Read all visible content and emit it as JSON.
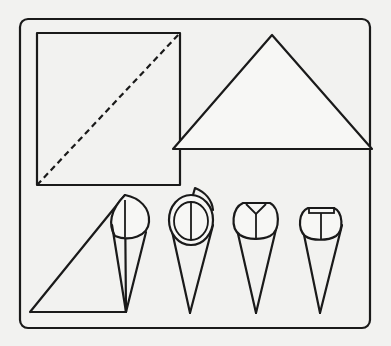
{
  "diagram": {
    "background_color": "#f2f2f0",
    "line_color": "#1a1a1a",
    "steps": [
      {
        "id": 1,
        "label": "square-with-diagonal-fold-line",
        "description": "Square sheet with dashed diagonal fold line"
      },
      {
        "id": 2,
        "label": "folded-triangle",
        "description": "Sheet folded into a triangle"
      },
      {
        "id": 3,
        "label": "rolling-cone",
        "description": "Triangle rolled into a cone"
      },
      {
        "id": 4,
        "label": "cone-rim-rolled",
        "description": "Cone with overlapping rolled rim"
      },
      {
        "id": 5,
        "label": "cone-flap-folded",
        "description": "Cone with top flap folded down"
      },
      {
        "id": 6,
        "label": "cone-flap-tucked",
        "description": "Cone with flap tucked in, finished"
      }
    ]
  }
}
